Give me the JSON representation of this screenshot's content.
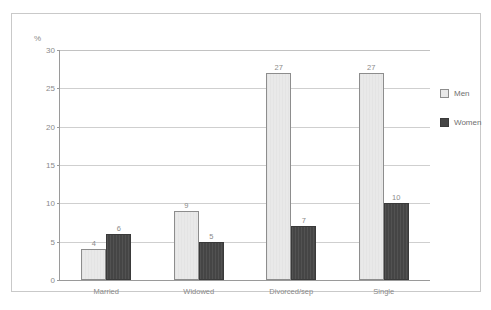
{
  "chart_data": {
    "type": "bar",
    "title": "",
    "subtitle": "",
    "xlabel": "",
    "ylabel": "%",
    "ylim": [
      0,
      30
    ],
    "yticks": [
      0,
      5,
      10,
      15,
      20,
      25,
      30
    ],
    "grid": true,
    "legend_position": "right",
    "categories": [
      "Married",
      "Widowed",
      "Divorced/sep",
      "Single"
    ],
    "series": [
      {
        "name": "Men",
        "color": "#e9e9e9",
        "values": [
          4,
          9,
          27,
          27
        ]
      },
      {
        "name": "Women",
        "color": "#454545",
        "values": [
          6,
          5,
          7,
          10
        ]
      }
    ]
  },
  "axis": {
    "unit_label": "%",
    "tick_labels": [
      "30",
      "25",
      "20",
      "15",
      "10",
      "5",
      "0"
    ]
  },
  "legend": {
    "items": [
      {
        "label": "Men",
        "swatch": "light-gray-swatch"
      },
      {
        "label": "Women",
        "swatch": "dark-gray-swatch"
      }
    ]
  },
  "caption": {
    "text": ""
  }
}
